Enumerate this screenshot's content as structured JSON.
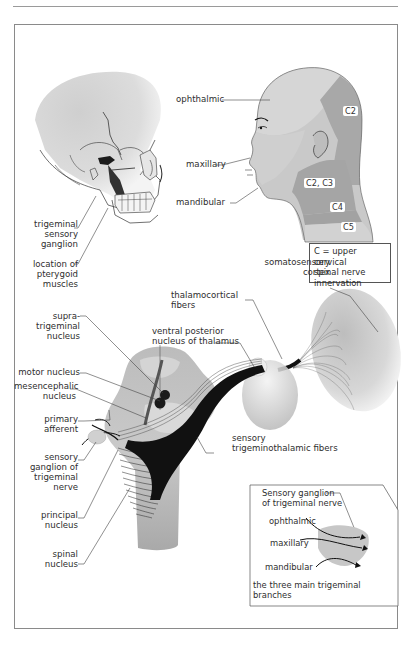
{
  "figure": {
    "panels": {
      "skull": {
        "labels": [
          {
            "id": "trigeminal-sensory-ganglion",
            "lines": [
              "trigeminal",
              "sensory",
              "ganglion"
            ]
          },
          {
            "id": "pterygoid-muscles",
            "lines": [
              "location of",
              "pterygoid",
              "muscles"
            ]
          }
        ]
      },
      "head_dermatomes": {
        "trigeminal_labels": [
          "ophthalmic",
          "maxillary",
          "mandibular"
        ],
        "cervical_tags": [
          "C2",
          "C2, C3",
          "C4",
          "C5"
        ],
        "legend": [
          "C = upper cervical",
          "spinal nerve",
          "innervation"
        ]
      },
      "pathway": {
        "left_labels": [
          {
            "id": "supratrigeminal-nucleus",
            "lines": [
              "supra-",
              "trigeminal",
              "nucleus"
            ]
          },
          {
            "id": "motor-nucleus",
            "lines": [
              "motor nucleus"
            ]
          },
          {
            "id": "mesencephalic-nucleus",
            "lines": [
              "mesencephalic",
              "nucleus"
            ]
          },
          {
            "id": "primary-afferent",
            "lines": [
              "primary",
              "afferent"
            ]
          },
          {
            "id": "sensory-ganglion",
            "lines": [
              "sensory",
              "ganglion of",
              "trigeminal",
              "nerve"
            ]
          },
          {
            "id": "principal-nucleus",
            "lines": [
              "principal",
              "nucleus"
            ]
          },
          {
            "id": "spinal-nucleus",
            "lines": [
              "spinal",
              "nucleus"
            ]
          }
        ],
        "right_labels": [
          {
            "id": "somatosensory-cortex",
            "lines": [
              "somatosensory",
              "cortex"
            ]
          },
          {
            "id": "thalamocortical-fibers",
            "lines": [
              "thalamocortical",
              "fibers"
            ]
          },
          {
            "id": "ventral-posterior-nucleus",
            "lines": [
              "ventral posterior",
              "nucleus of thalamus"
            ]
          },
          {
            "id": "trigeminothalamic-fibers",
            "lines": [
              "sensory",
              "trigeminothalamic fibers"
            ]
          }
        ]
      },
      "inset": {
        "title": [
          "Sensory ganglion",
          "of trigeminal nerve"
        ],
        "branches": [
          "ophthalmic",
          "maxillary",
          "mandibular"
        ],
        "caption": [
          "the three main trigeminal",
          "branches"
        ]
      }
    },
    "colors": {
      "frame": "#8a8a8a",
      "skin_light": "#d9d9d9",
      "skin_mid": "#bdbdbd",
      "skin_dark": "#a8a8a8",
      "fiber": "#111111"
    }
  }
}
